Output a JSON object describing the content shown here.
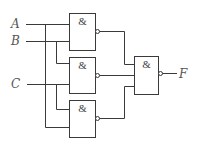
{
  "diagram": {
    "type": "logic-circuit",
    "inputs": [
      {
        "id": "A",
        "label": "A"
      },
      {
        "id": "B",
        "label": "B"
      },
      {
        "id": "C",
        "label": "C"
      }
    ],
    "output": {
      "id": "F",
      "label": "F"
    },
    "gates": [
      {
        "id": "g1",
        "type": "NAND",
        "symbol": "&",
        "inputs": [
          "A",
          "B"
        ]
      },
      {
        "id": "g2",
        "type": "NAND",
        "symbol": "&",
        "inputs": [
          "B",
          "C"
        ]
      },
      {
        "id": "g3",
        "type": "NAND",
        "symbol": "&",
        "inputs": [
          "C",
          "A"
        ]
      },
      {
        "id": "g4",
        "type": "NAND",
        "symbol": "&",
        "inputs": [
          "g1",
          "g2",
          "g3"
        ]
      }
    ],
    "colors": {
      "line": "#3a3a3a",
      "label": "#555555",
      "background": "#ffffff"
    }
  }
}
